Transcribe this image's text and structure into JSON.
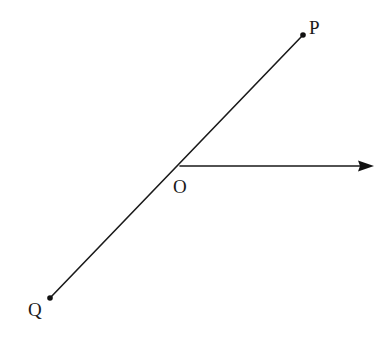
{
  "diagram": {
    "type": "geometry-angle",
    "colors": {
      "stroke": "#1a1a1a",
      "background": "#ffffff"
    },
    "points": {
      "P": {
        "label": "P",
        "x": 303,
        "y": 35
      },
      "O": {
        "label": "O",
        "x": 180,
        "y": 166
      },
      "Q": {
        "label": "Q",
        "x": 50,
        "y": 298
      }
    },
    "segments": [
      {
        "name": "line-PQ",
        "from": "P",
        "to": "Q",
        "through": "O"
      }
    ],
    "rays": [
      {
        "name": "ray-O-right",
        "from": "O",
        "direction": "right",
        "end_x": 374,
        "end_y": 166
      }
    ],
    "labels": [
      {
        "text": "P",
        "x": 309,
        "y": 34
      },
      {
        "text": "O",
        "x": 173,
        "y": 192
      },
      {
        "text": "Q",
        "x": 28,
        "y": 316
      }
    ]
  }
}
